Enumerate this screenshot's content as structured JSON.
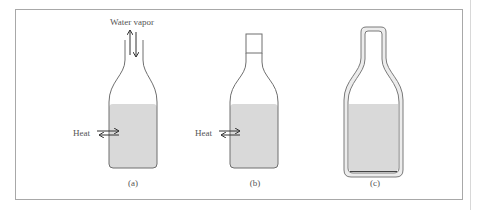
{
  "figure": {
    "panels": [
      {
        "id": "a",
        "caption": "(a)",
        "top_label": "Water vapor",
        "side_label": "Heat",
        "closure": "open"
      },
      {
        "id": "b",
        "caption": "(b)",
        "side_label": "Heat",
        "closure": "stoppered"
      },
      {
        "id": "c",
        "caption": "(c)",
        "closure": "insulated-sealed"
      }
    ],
    "colors": {
      "liquid": "#d9d9d9",
      "outline": "#6f6f6f",
      "frame": "#a8a8a8",
      "text": "#555555"
    }
  }
}
